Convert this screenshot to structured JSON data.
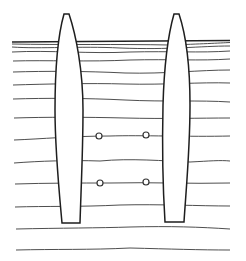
{
  "diagram": {
    "title": "",
    "colors": {
      "background": "#ffffff",
      "line": "#222222"
    },
    "ground_surface_y": 42,
    "soil_layers_y": [
      44,
      48,
      52,
      61,
      72,
      85,
      99,
      118,
      140,
      162,
      184,
      207,
      229,
      250
    ],
    "piles": [
      {
        "id": "left-pile",
        "top_y": 14,
        "bottom_y": 223,
        "top_x": [
          64,
          69
        ],
        "bottom_x": [
          62,
          80
        ]
      },
      {
        "id": "right-pile",
        "top_y": 14,
        "bottom_y": 222,
        "top_x": [
          174,
          179
        ],
        "bottom_x": [
          165,
          184
        ]
      }
    ],
    "measurement_points": [
      {
        "x": 99,
        "y": 136
      },
      {
        "x": 146,
        "y": 135
      },
      {
        "x": 100,
        "y": 183
      },
      {
        "x": 146,
        "y": 182
      }
    ]
  }
}
